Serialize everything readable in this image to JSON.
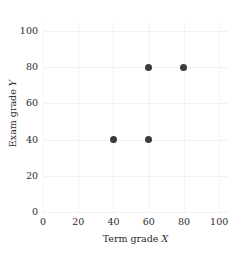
{
  "chart_data": {
    "type": "scatter",
    "title": "",
    "xlabel": "Term grade X",
    "ylabel": "Exam grade Y",
    "xlabel_text": "Term grade",
    "xlabel_var": "X",
    "ylabel_text": "Exam grade",
    "ylabel_var": "Y",
    "xlim": [
      0,
      105
    ],
    "ylim": [
      0,
      105
    ],
    "xticks": [
      0,
      20,
      40,
      60,
      80,
      100
    ],
    "yticks": [
      0,
      20,
      40,
      60,
      80,
      100
    ],
    "xtick_labels": [
      "0",
      "20",
      "40",
      "60",
      "80",
      "100"
    ],
    "ytick_labels": [
      "0",
      "20",
      "40",
      "60",
      "80",
      "100"
    ],
    "grid": true,
    "grid_color": "#f2f2f2",
    "legend": null,
    "marker_color": "#3b3b3b",
    "marker_size": 7,
    "background": "#ffffff",
    "points": [
      {
        "x": 40,
        "y": 40
      },
      {
        "x": 60,
        "y": 40
      },
      {
        "x": 60,
        "y": 80
      },
      {
        "x": 80,
        "y": 80
      }
    ]
  }
}
